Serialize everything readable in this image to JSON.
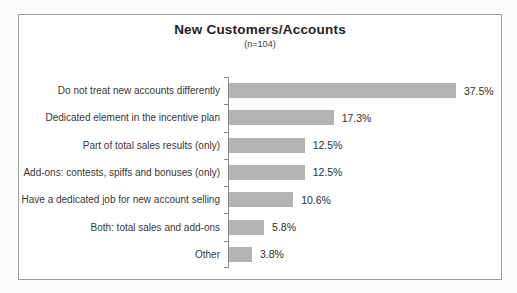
{
  "chart_data": {
    "type": "bar",
    "orientation": "horizontal",
    "title": "New Customers/Accounts",
    "subtitle": "(n=104)",
    "categories": [
      "Do not treat new accounts differently",
      "Dedicated element in the incentive plan",
      "Part of total sales results (only)",
      "Add-ons: contests, spiffs and bonuses (only)",
      "Have a dedicated job for new account selling",
      "Both: total sales and add-ons",
      "Other"
    ],
    "values": [
      37.5,
      17.3,
      12.5,
      12.5,
      10.6,
      5.8,
      3.8
    ],
    "value_labels": [
      "37.5%",
      "17.3%",
      "12.5%",
      "12.5%",
      "10.6%",
      "5.8%",
      "3.8%"
    ],
    "xlim": [
      0,
      40
    ],
    "grid": false,
    "legend": false,
    "bar_color": "#b3b3b3",
    "axis_color": "#8a8a8a"
  }
}
